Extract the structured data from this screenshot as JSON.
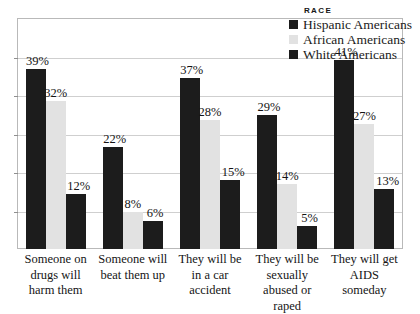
{
  "chart_data": {
    "type": "bar",
    "title": "",
    "subtitle": "",
    "xlabel": "",
    "ylabel": "",
    "ylim": [
      0,
      50
    ],
    "grid": true,
    "legend_position": "top-right",
    "legend_title": "RACE",
    "categories": [
      "Someone on drugs will harm them",
      "Someone will beat them up",
      "They will be in a car accident",
      "They will be sexually abused or raped",
      "They will get AIDS someday"
    ],
    "category_lines": [
      [
        "Someone on",
        "drugs will",
        "harm them"
      ],
      [
        "Someone will",
        "beat them up"
      ],
      [
        "They will be",
        "in a car",
        "accident"
      ],
      [
        "They will be",
        "sexually",
        "abused or raped"
      ],
      [
        "They will get",
        "AIDS",
        "someday"
      ]
    ],
    "series": [
      {
        "name": "Hispanic Americans",
        "color": "#1c1c1c",
        "values": [
          39,
          22,
          37,
          29,
          41
        ],
        "labels": [
          "39%",
          "22%",
          "37%",
          "29%",
          "41%"
        ]
      },
      {
        "name": "African Americans",
        "color": "#e2e2e2",
        "values": [
          32,
          8,
          28,
          14,
          27
        ],
        "labels": [
          "32%",
          "8%",
          "28%",
          "14%",
          "27%"
        ]
      },
      {
        "name": "White Americans",
        "color": "#1c1c1c",
        "values": [
          12,
          6,
          15,
          5,
          13
        ],
        "labels": [
          "12%",
          "6%",
          "15%",
          "5%",
          "13%"
        ]
      }
    ],
    "gridline_count": 6,
    "colors": {
      "frame": "#b9b9b9",
      "gridline": "#cfcfcf",
      "background": "#ffffff",
      "text": "#151515"
    }
  }
}
